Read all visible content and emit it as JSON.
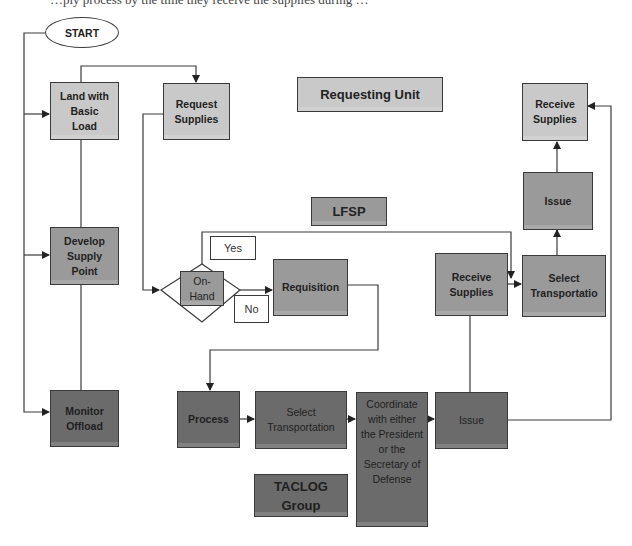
{
  "diagram": {
    "top_clipped_text": "…ply process by the time they receive the supplies during …",
    "start": "START",
    "section_labels": {
      "requesting_unit": "Requesting Unit",
      "lfsp": "LFSP",
      "taclog": "TACLOG Group"
    },
    "nodes": {
      "land_basic_load": "Land with Basic Load",
      "request_supplies": "Request Supplies",
      "develop_supply_point": "Develop Supply Point",
      "monitor_offload": "Monitor Offload",
      "on_hand": "On-Hand",
      "requisition": "Requisition",
      "lfsp_receive_supplies": "Receive Supplies",
      "lfsp_select_transport": "Select Transportatio",
      "lfsp_issue": "Issue",
      "ru_receive_supplies": "Receive Supplies",
      "process": "Process",
      "taclog_select_transport": "Select Transportation",
      "coordinate": "Coordinate with either the President or the Secretary of Defense",
      "taclog_issue": "Issue"
    },
    "decision_labels": {
      "yes": "Yes",
      "no": "No"
    },
    "colors": {
      "requesting_unit": "#c9c9c9",
      "lfsp": "#9a9a9a",
      "taclog": "#6b6b6b",
      "line": "#3a3a3a"
    }
  }
}
